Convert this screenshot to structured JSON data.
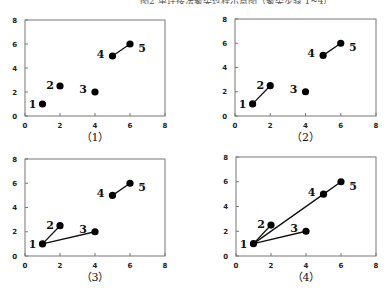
{
  "header": {
    "cut_text": "图2  单连接法聚类过程示意图（聚类步骤 1~4）"
  },
  "chart_data": [
    {
      "type": "scatter",
      "caption": "（1）",
      "xlim": [
        0,
        8
      ],
      "ylim": [
        0,
        8
      ],
      "xticks": [
        0,
        2,
        4,
        6,
        8
      ],
      "yticks": [
        0,
        2,
        4,
        6,
        8
      ],
      "points": [
        {
          "label": "1",
          "x": 1,
          "y": 1
        },
        {
          "label": "2",
          "x": 2,
          "y": 2.5
        },
        {
          "label": "3",
          "x": 4,
          "y": 2
        },
        {
          "label": "4",
          "x": 5,
          "y": 5
        },
        {
          "label": "5",
          "x": 6,
          "y": 6
        }
      ],
      "links": [
        [
          4,
          5
        ]
      ]
    },
    {
      "type": "scatter",
      "caption": "（2）",
      "xlim": [
        0,
        8
      ],
      "ylim": [
        0,
        8
      ],
      "xticks": [
        0,
        2,
        4,
        6,
        8
      ],
      "yticks": [
        0,
        2,
        4,
        6,
        8
      ],
      "points": [
        {
          "label": "1",
          "x": 1,
          "y": 1
        },
        {
          "label": "2",
          "x": 2,
          "y": 2.5
        },
        {
          "label": "3",
          "x": 4,
          "y": 2
        },
        {
          "label": "4",
          "x": 5,
          "y": 5
        },
        {
          "label": "5",
          "x": 6,
          "y": 6
        }
      ],
      "links": [
        [
          4,
          5
        ],
        [
          1,
          2
        ]
      ]
    },
    {
      "type": "scatter",
      "caption": "（3）",
      "xlim": [
        0,
        8
      ],
      "ylim": [
        0,
        8
      ],
      "xticks": [
        0,
        2,
        4,
        6,
        8
      ],
      "yticks": [
        0,
        2,
        4,
        6,
        8
      ],
      "points": [
        {
          "label": "1",
          "x": 1,
          "y": 1
        },
        {
          "label": "2",
          "x": 2,
          "y": 2.5
        },
        {
          "label": "3",
          "x": 4,
          "y": 2
        },
        {
          "label": "4",
          "x": 5,
          "y": 5
        },
        {
          "label": "5",
          "x": 6,
          "y": 6
        }
      ],
      "links": [
        [
          4,
          5
        ],
        [
          1,
          2
        ],
        [
          1,
          3
        ]
      ]
    },
    {
      "type": "scatter",
      "caption": "（4）",
      "xlim": [
        0,
        8
      ],
      "ylim": [
        0,
        8
      ],
      "xticks": [
        0,
        2,
        4,
        6,
        8
      ],
      "yticks": [
        0,
        2,
        4,
        6,
        8
      ],
      "points": [
        {
          "label": "1",
          "x": 1,
          "y": 1
        },
        {
          "label": "2",
          "x": 2,
          "y": 2.5
        },
        {
          "label": "3",
          "x": 4,
          "y": 2
        },
        {
          "label": "4",
          "x": 5,
          "y": 5
        },
        {
          "label": "5",
          "x": 6,
          "y": 6
        }
      ],
      "links": [
        [
          4,
          5
        ],
        [
          1,
          2
        ],
        [
          1,
          3
        ],
        [
          1,
          4
        ]
      ]
    }
  ],
  "layout": {
    "panels": [
      {
        "left": 25,
        "top": 20,
        "right": 165,
        "bottom": 116,
        "caption_y": 141
      },
      {
        "left": 235,
        "top": 19,
        "right": 376,
        "bottom": 116,
        "caption_y": 141
      },
      {
        "left": 25,
        "top": 159,
        "right": 165,
        "bottom": 256,
        "caption_y": 281
      },
      {
        "left": 236,
        "top": 157,
        "right": 376,
        "bottom": 256,
        "caption_y": 281
      }
    ],
    "label_offsets": {
      "1": [
        -10,
        0
      ],
      "2": [
        -10,
        -1
      ],
      "3": [
        -12,
        -3
      ],
      "4": [
        -12,
        -2
      ],
      "5": [
        12,
        4
      ]
    }
  }
}
